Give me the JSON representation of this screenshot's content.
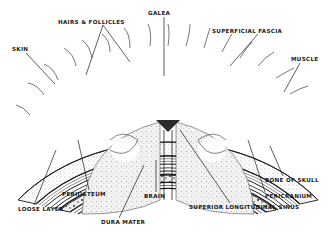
{
  "diagram": {
    "colors": {
      "ink": "#1a1a1a",
      "paper": "#ffffff",
      "shade": "#8a8a8a"
    },
    "labels": [
      {
        "id": "galea",
        "text": "GALEA",
        "x": 148,
        "y": 11
      },
      {
        "id": "hairs-follicles",
        "text": "HAIRS & FOLLICLES",
        "x": 58,
        "y": 20
      },
      {
        "id": "superficial-fascia",
        "text": "SUPERFICIAL FASCIA",
        "x": 212,
        "y": 29
      },
      {
        "id": "skin",
        "text": "SKIN",
        "x": 12,
        "y": 47
      },
      {
        "id": "muscle",
        "text": "MUSCLE",
        "x": 291,
        "y": 57
      },
      {
        "id": "bone-of-skull",
        "text": "BONE OF SKULL",
        "x": 265,
        "y": 178
      },
      {
        "id": "pericranium",
        "text": "PERICRANIUM",
        "x": 265,
        "y": 194
      },
      {
        "id": "periosteum",
        "text": "PERIOSTEUM",
        "x": 62,
        "y": 192
      },
      {
        "id": "brain",
        "text": "BRAIN",
        "x": 144,
        "y": 194
      },
      {
        "id": "superior-longitudinal-sinus",
        "text": "SUPERIOR LONGITUDINAL SINUS",
        "x": 189,
        "y": 205
      },
      {
        "id": "loose-layer",
        "text": "LOOSE LAYER",
        "x": 18,
        "y": 207
      },
      {
        "id": "dura-mater",
        "text": "DURA MATER",
        "x": 101,
        "y": 220
      }
    ]
  }
}
